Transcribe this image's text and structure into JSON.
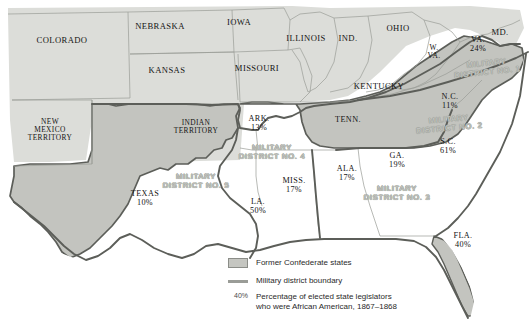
{
  "map": {
    "title": "Reconstruction Military Districts and African American State Legislators, 1867-1868",
    "colors": {
      "confederate_fill": "#c3c4bf",
      "union_fill": "#dcddd9",
      "confederate_border": "#5c5e59",
      "state_border": "#9a9c97",
      "district_label": "#c9cbc6",
      "ocean": "#ffffff",
      "text": "#141414"
    },
    "union_states": [
      {
        "name": "COLORADO",
        "x": 62,
        "y": 41
      },
      {
        "name": "NEBRASKA",
        "x": 160,
        "y": 27
      },
      {
        "name": "IOWA",
        "x": 239,
        "y": 23
      },
      {
        "name": "KANSAS",
        "x": 167,
        "y": 71
      },
      {
        "name": "MISSOURI",
        "x": 257,
        "y": 69
      },
      {
        "name": "ILLINOIS",
        "x": 306,
        "y": 39
      },
      {
        "name": "IND.",
        "x": 348,
        "y": 39
      },
      {
        "name": "OHIO",
        "x": 398,
        "y": 29
      },
      {
        "name": "W.\nVA.",
        "x": 434,
        "y": 52
      },
      {
        "name": "MD.",
        "x": 500,
        "y": 33
      },
      {
        "name": "KENTUCKY",
        "x": 379,
        "y": 87
      },
      {
        "name": "NEW\nMEXICO\nTERRITORY",
        "x": 50,
        "y": 130
      },
      {
        "name": "INDIAN\nTERRITORY",
        "x": 196,
        "y": 127
      }
    ],
    "confederate_states": [
      {
        "name": "ARK.",
        "pct": "13%",
        "x": 259,
        "y": 124
      },
      {
        "name": "TENN.",
        "pct": "",
        "x": 348,
        "y": 120
      },
      {
        "name": "TEXAS",
        "pct": "10%",
        "x": 145,
        "y": 199
      },
      {
        "name": "LA.",
        "pct": "50%",
        "x": 258,
        "y": 207
      },
      {
        "name": "MISS.",
        "pct": "17%",
        "x": 294,
        "y": 186
      },
      {
        "name": "ALA.",
        "pct": "17%",
        "x": 347,
        "y": 174
      },
      {
        "name": "GA.",
        "pct": "19%",
        "x": 397,
        "y": 161
      },
      {
        "name": "FLA.",
        "pct": "40%",
        "x": 463,
        "y": 241
      },
      {
        "name": "S.C.",
        "pct": "61%",
        "x": 448,
        "y": 147
      },
      {
        "name": "N.C.",
        "pct": "11%",
        "x": 450,
        "y": 102
      },
      {
        "name": "VA.",
        "pct": "24%",
        "x": 478,
        "y": 45
      }
    ],
    "districts": [
      {
        "name": "MILITARY\nDISTRICT NO. 1",
        "x": 487,
        "y": 68,
        "rot": -6
      },
      {
        "name": "MILITARY\nDISTRICT NO. 2",
        "x": 449,
        "y": 124,
        "rot": -5
      },
      {
        "name": "MILITARY\nDISTRICT NO. 3",
        "x": 397,
        "y": 193,
        "rot": 0
      },
      {
        "name": "MILITARY\nDISTRICT NO. 4",
        "x": 272,
        "y": 152,
        "rot": 0
      },
      {
        "name": "MILITARY\nDISTRICT NO. 5",
        "x": 196,
        "y": 181,
        "rot": 0
      }
    ]
  },
  "legend": {
    "items": [
      {
        "marker": "swatch",
        "label": "Former Confederate states"
      },
      {
        "marker": "line",
        "label": "Military district boundary"
      },
      {
        "marker": "40%",
        "label": "Percentage of elected state legislators\nwho were African American, 1867–1868"
      }
    ]
  }
}
